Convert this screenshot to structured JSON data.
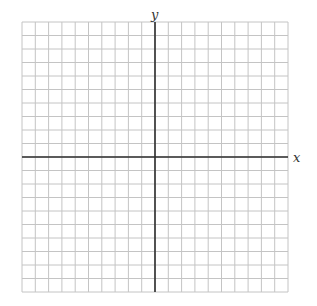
{
  "chart_data": {
    "type": "table",
    "subtype": "coordinate-plane",
    "title": "",
    "xlabel": "x",
    "ylabel": "y",
    "grid": true,
    "xlim": [
      -10,
      10
    ],
    "ylim": [
      -10,
      10
    ],
    "x_cells": 20,
    "y_cells": 20,
    "tick_labels": false,
    "series": [],
    "legend": null
  },
  "labels": {
    "x": "x",
    "y": "y"
  },
  "layout": {
    "grid_left": 22,
    "grid_top": 22,
    "grid_right": 288,
    "grid_bottom": 292,
    "origin_x": 155,
    "origin_y": 158
  },
  "colors": {
    "grid_line": "#c4c4c4",
    "axis_line": "#2e2e2e",
    "label": "#333333",
    "background": "#ffffff"
  }
}
